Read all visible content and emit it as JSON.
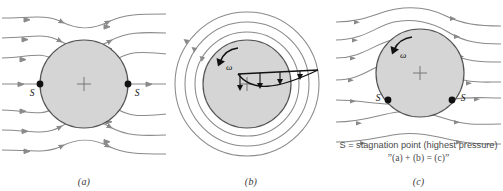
{
  "figure": {
    "background": "#ffffff",
    "cylinder_fill": "#d5d5d5",
    "cylinder_stroke": "#555555",
    "streamline_color": "#8a8a8a",
    "marker_color": "#111111",
    "text_color": "#4a4a4a"
  },
  "panels": [
    {
      "id": "a",
      "label": "(a)",
      "description": "Uniform flow past a stationary cylinder, symmetric streamlines",
      "stagnation_labels": [
        "S",
        "S"
      ],
      "stagnation_positions": [
        "left",
        "right"
      ],
      "center_marker": "plus-marker",
      "streamline_count": 7,
      "rotation_label": null
    },
    {
      "id": "b",
      "label": "(b)",
      "description": "Pure vortex flow: concentric circular streamlines with 1/r velocity profile",
      "stagnation_labels": [],
      "stagnation_positions": [],
      "center_marker": "plus-marker",
      "streamline_count": 4,
      "rotation_label": "ω",
      "velocity_profile_arrows": 4
    },
    {
      "id": "c",
      "label": "(c)",
      "description": "Combined flow: rotating cylinder in uniform stream, Magnus effect, stagnation points shifted downward",
      "stagnation_labels": [
        "S",
        "S"
      ],
      "stagnation_positions": [
        "lower-left",
        "lower-right"
      ],
      "center_marker": "plus-marker",
      "streamline_count": 7,
      "rotation_label": "ω"
    }
  ],
  "caption": {
    "line1": "S = stagnation point (highest pressure)",
    "line2_prefix": "”(",
    "line2": "”(a) + (b) = (c)”",
    "line2_parts": {
      "open_quote": "”",
      "a": "a",
      "plus": ") + (",
      "b": "b",
      "equals": ") = (",
      "c": "c",
      "close": ")”"
    }
  }
}
